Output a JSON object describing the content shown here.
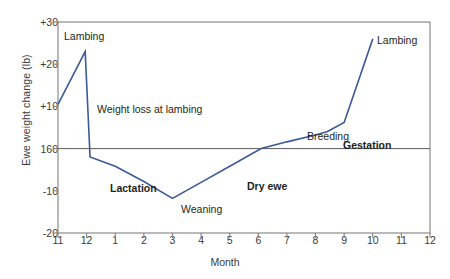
{
  "chart_data": {
    "type": "line",
    "title": "",
    "xlabel": "Month",
    "ylabel": "Ewe weight change (lb)",
    "xlim": [
      0,
      13
    ],
    "ylim": [
      -20,
      30
    ],
    "grid": false,
    "legend": "none",
    "line_color": "#3a5a9a",
    "axis_color": "#808080",
    "zero_line_label": "160",
    "x_tick_labels": [
      "11",
      "12",
      "1",
      "2",
      "3",
      "4",
      "5",
      "6",
      "7",
      "8",
      "9",
      "10",
      "11",
      "12"
    ],
    "y_tick_labels": [
      "+30",
      "+20",
      "+10",
      "160",
      "-10",
      "-20"
    ],
    "y_tick_values": [
      30,
      20,
      10,
      0,
      -10,
      -20
    ],
    "series": [
      {
        "name": "Ewe weight change",
        "x": [
          0.0,
          0.95,
          1.12,
          2.0,
          3.0,
          4.0,
          5.0,
          6.05,
          7.1,
          8.0,
          9.0,
          9.4,
          10.0,
          11.0
        ],
        "y": [
          10.5,
          23.0,
          -2.0,
          -4.2,
          -7.8,
          -11.8,
          -8.0,
          -4.0,
          0.0,
          1.6,
          3.2,
          4.0,
          6.2,
          26.0
        ]
      }
    ],
    "annotations": [
      {
        "text": "Lambing",
        "bold": false,
        "left": 64,
        "top": 30
      },
      {
        "text": "Weight loss at lambing",
        "bold": false,
        "left": 97,
        "top": 103
      },
      {
        "text": "Lactation",
        "bold": true,
        "left": 110,
        "top": 182
      },
      {
        "text": "Weaning",
        "bold": false,
        "left": 181,
        "top": 203
      },
      {
        "text": "Dry ewe",
        "bold": true,
        "left": 247,
        "top": 180
      },
      {
        "text": "Breeding",
        "bold": false,
        "left": 307,
        "top": 130
      },
      {
        "text": "Gestation",
        "bold": true,
        "left": 343,
        "top": 139
      },
      {
        "text": "Lambing",
        "bold": false,
        "left": 377,
        "top": 34
      }
    ]
  }
}
